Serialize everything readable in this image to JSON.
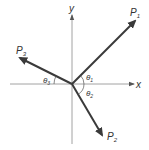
{
  "diagram": {
    "type": "vector-force-diagram",
    "axes": {
      "x_label": "x",
      "y_label": "y"
    },
    "vectors": [
      {
        "id": "P1",
        "label": "P",
        "subscript": "1",
        "direction": "upper-right"
      },
      {
        "id": "P2",
        "label": "P",
        "subscript": "2",
        "direction": "lower-right"
      },
      {
        "id": "P3",
        "label": "P",
        "subscript": "3",
        "direction": "upper-left"
      }
    ],
    "angles": [
      {
        "id": "theta1",
        "label": "θ",
        "subscript": "1",
        "between": "P1 and +x axis"
      },
      {
        "id": "theta2",
        "label": "θ",
        "subscript": "2",
        "between": "P2 and +x axis"
      },
      {
        "id": "theta3",
        "label": "θ",
        "subscript": "3",
        "between": "P3 and -x axis"
      }
    ],
    "colors": {
      "axis": "#8a8a8a",
      "vector": "#3a3a3a",
      "text": "#333333"
    }
  }
}
